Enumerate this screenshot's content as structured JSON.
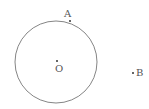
{
  "diagram": {
    "circle": {
      "cx": 56,
      "cy": 62,
      "r": 41,
      "stroke": "#777777"
    },
    "points": [
      {
        "id": "A",
        "label": "A",
        "x": 70,
        "y": 21,
        "lx": 64,
        "ly": 17
      },
      {
        "id": "O",
        "label": "O",
        "x": 57,
        "y": 61,
        "lx": 55,
        "ly": 72
      },
      {
        "id": "B",
        "label": "B",
        "x": 133,
        "y": 73,
        "lx": 136,
        "ly": 76
      }
    ]
  }
}
